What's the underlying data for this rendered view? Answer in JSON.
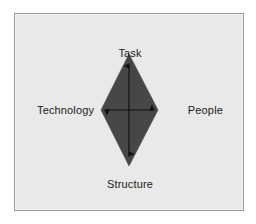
{
  "figure": {
    "type": "diagram",
    "background_color": "#ffffff",
    "panel_color": "#e9e9e9",
    "panel_border_color": "#9a9a9a",
    "shape": {
      "name": "diamond",
      "fill_color": "#474747",
      "vertices": [
        {
          "name": "top",
          "x": 114,
          "y": 40
        },
        {
          "name": "right",
          "x": 143,
          "y": 96
        },
        {
          "name": "bottom",
          "x": 114,
          "y": 152
        },
        {
          "name": "left",
          "x": 86,
          "y": 96
        }
      ]
    },
    "arrows": {
      "stroke_color": "#111111",
      "style": "double-headed",
      "vertical": {
        "x": 114,
        "y1": 52,
        "y2": 140
      },
      "horizontal": {
        "y": 96,
        "x1": 92,
        "x2": 137
      }
    }
  },
  "labels": {
    "task": "Task",
    "technology": "Technology",
    "people": "People",
    "structure": "Structure"
  }
}
